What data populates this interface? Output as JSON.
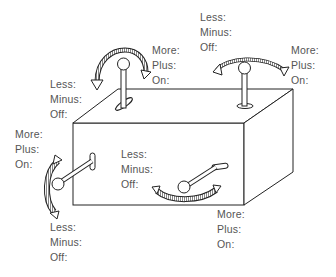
{
  "diagram": {
    "levers": [
      {
        "id": "top-left-lever",
        "type": "rotary lever on top face",
        "labels_increase": [
          "More:",
          "Plus:",
          "On:"
        ],
        "labels_decrease": [
          "Less:",
          "Minus:",
          "Off:"
        ]
      },
      {
        "id": "top-right-lever",
        "type": "vertical lever on top face, arc left-right",
        "labels_increase": [
          "More:",
          "Plus:",
          "On:"
        ],
        "labels_decrease": [
          "Less:",
          "Minus:",
          "Off:"
        ]
      },
      {
        "id": "left-side-lever",
        "type": "lever protruding from left edge, arc up-down",
        "labels_increase": [
          "More:",
          "Plus:",
          "On:"
        ],
        "labels_decrease": [
          "Less:",
          "Minus:",
          "Off:"
        ]
      },
      {
        "id": "front-lever",
        "type": "lever on front face, arc left-right",
        "labels_increase": [
          "More:",
          "Plus:",
          "On:"
        ],
        "labels_decrease": [
          "Less:",
          "Minus:",
          "Off:"
        ]
      }
    ]
  },
  "labels": {
    "top_left_increase": {
      "l1": "More:",
      "l2": "Plus:",
      "l3": "On:"
    },
    "top_left_decrease": {
      "l1": "Less:",
      "l2": "Minus:",
      "l3": "Off:"
    },
    "top_right_decrease": {
      "l1": "Less:",
      "l2": "Minus:",
      "l3": "Off:"
    },
    "top_right_increase": {
      "l1": "More:",
      "l2": "Plus:",
      "l3": "On:"
    },
    "left_increase": {
      "l1": "More:",
      "l2": "Plus:",
      "l3": "On:"
    },
    "left_decrease": {
      "l1": "Less:",
      "l2": "Minus:",
      "l3": "Off:"
    },
    "front_decrease": {
      "l1": "Less:",
      "l2": "Minus:",
      "l3": "Off:"
    },
    "front_increase": {
      "l1": "More:",
      "l2": "Plus:",
      "l3": "On:"
    }
  },
  "colors": {
    "line": "#222222",
    "text": "#555555",
    "background": "#ffffff"
  }
}
